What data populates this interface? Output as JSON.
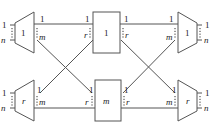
{
  "diagram": {
    "type": "switching-network",
    "nodes": {
      "top_left": {
        "label": "1",
        "left_ports": [
          "1",
          "n"
        ],
        "right_ports": [
          "1",
          "m"
        ]
      },
      "top_center": {
        "label": "1",
        "left_ports": [
          "1",
          "r"
        ],
        "right_ports": [
          "1",
          "r"
        ]
      },
      "top_right": {
        "label": "1",
        "left_ports": [
          "1",
          "m"
        ],
        "right_ports": [
          "1",
          "n"
        ]
      },
      "bottom_left": {
        "label": "r",
        "left_ports": [
          "1",
          "n"
        ],
        "right_ports": [
          "1",
          "m"
        ]
      },
      "bottom_center": {
        "label": "m",
        "left_ports": [
          "1",
          "r"
        ],
        "right_ports": [
          "1",
          "r"
        ]
      },
      "bottom_right": {
        "label": "r",
        "left_ports": [
          "1",
          "m"
        ],
        "right_ports": [
          "1",
          "n"
        ]
      }
    },
    "edges": [
      "top_left.1 -> top_center.1",
      "top_left.m -> bottom_center.1",
      "bottom_left.1 -> top_center.r",
      "bottom_left.m -> bottom_center.r",
      "top_center.1 -> top_right.1",
      "top_center.r -> bottom_right.1",
      "bottom_center.1 -> top_right.m",
      "bottom_center.r -> bottom_right.m"
    ],
    "colors": {
      "stroke": "#555555",
      "text": "#222222"
    }
  }
}
